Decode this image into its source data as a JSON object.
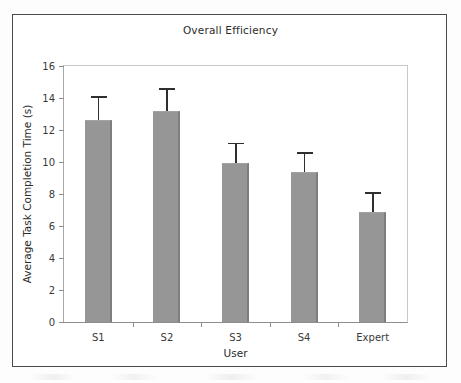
{
  "chart_data": {
    "type": "bar",
    "title": "Overall Efficiency",
    "xlabel": "User",
    "ylabel": "Average Task Completion Time (s)",
    "categories": [
      "S1",
      "S2",
      "S3",
      "S4",
      "Expert"
    ],
    "values": [
      12.6,
      13.2,
      9.95,
      9.4,
      6.9
    ],
    "errors": [
      1.5,
      1.4,
      1.25,
      1.2,
      1.2
    ],
    "error_bar_type": "symmetric",
    "ylim": [
      0,
      16
    ],
    "yticks": [
      0,
      2,
      4,
      6,
      8,
      10,
      12,
      14,
      16
    ],
    "ytick_labels": [
      "0",
      "2",
      "4",
      "6",
      "8",
      "10",
      "12",
      "14",
      "16"
    ],
    "grid": false,
    "legend": false,
    "bar_color": "#969696",
    "bar_edge_color": "#7e7e7e",
    "error_bar_color": "#2f2f2f",
    "axis_color": "#8e8e8e",
    "text_color": "#2b2b2b",
    "background": "#ffffff"
  }
}
